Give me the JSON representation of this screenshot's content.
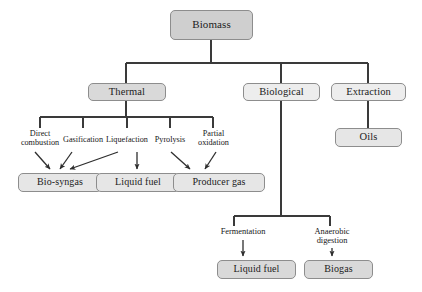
{
  "diagram": {
    "colors": {
      "box_border": "#8d8d8d",
      "box_fill_dark": "#cfcfcf",
      "box_fill_mid": "#d9d9d9",
      "box_fill_light": "#e6e6e6",
      "box_fill_pale": "#ededed",
      "line": "#3a3a3a",
      "text": "#161616",
      "background": "#ffffff"
    },
    "nodes": {
      "root": {
        "label": "Biomass"
      },
      "level1": [
        {
          "label": "Thermal"
        },
        {
          "label": "Biological"
        },
        {
          "label": "Extraction"
        }
      ],
      "thermal_processes": [
        {
          "line1": "Direct",
          "line2": "combustion"
        },
        {
          "line1": "Gasification",
          "line2": ""
        },
        {
          "line1": "Liquefaction",
          "line2": ""
        },
        {
          "line1": "Pyrolysis",
          "line2": ""
        },
        {
          "line1": "Partial",
          "line2": "oxidation"
        }
      ],
      "thermal_products": [
        {
          "label": "Bio-syngas"
        },
        {
          "label": "Liquid fuel"
        },
        {
          "label": "Producer gas"
        }
      ],
      "biological_processes": [
        {
          "line1": "Fermentation",
          "line2": ""
        },
        {
          "line1": "Anaerobic",
          "line2": "digestion"
        }
      ],
      "biological_products": [
        {
          "label": "Liquid fuel"
        },
        {
          "label": "Biogas"
        }
      ],
      "extraction_products": [
        {
          "label": "Oils"
        }
      ]
    },
    "edges": [
      {
        "from": "Biomass",
        "to": "Thermal",
        "arrow": false
      },
      {
        "from": "Biomass",
        "to": "Biological",
        "arrow": false
      },
      {
        "from": "Biomass",
        "to": "Extraction",
        "arrow": false
      },
      {
        "from": "Thermal",
        "to": "Direct combustion",
        "arrow": false
      },
      {
        "from": "Thermal",
        "to": "Gasification",
        "arrow": false
      },
      {
        "from": "Thermal",
        "to": "Liquefaction",
        "arrow": false
      },
      {
        "from": "Thermal",
        "to": "Pyrolysis",
        "arrow": false
      },
      {
        "from": "Thermal",
        "to": "Partial oxidation",
        "arrow": false
      },
      {
        "from": "Direct combustion",
        "to": "Bio-syngas",
        "arrow": true
      },
      {
        "from": "Gasification",
        "to": "Bio-syngas",
        "arrow": true
      },
      {
        "from": "Liquefaction",
        "to": "Bio-syngas",
        "arrow": true
      },
      {
        "from": "Liquefaction",
        "to": "Liquid fuel",
        "arrow": true
      },
      {
        "from": "Pyrolysis",
        "to": "Producer gas",
        "arrow": true
      },
      {
        "from": "Partial oxidation",
        "to": "Producer gas",
        "arrow": true
      },
      {
        "from": "Biological",
        "to": "Fermentation",
        "arrow": false
      },
      {
        "from": "Biological",
        "to": "Anaerobic digestion",
        "arrow": false
      },
      {
        "from": "Fermentation",
        "to": "Liquid fuel",
        "arrow": true
      },
      {
        "from": "Anaerobic digestion",
        "to": "Biogas",
        "arrow": true
      },
      {
        "from": "Extraction",
        "to": "Oils",
        "arrow": false
      }
    ]
  }
}
